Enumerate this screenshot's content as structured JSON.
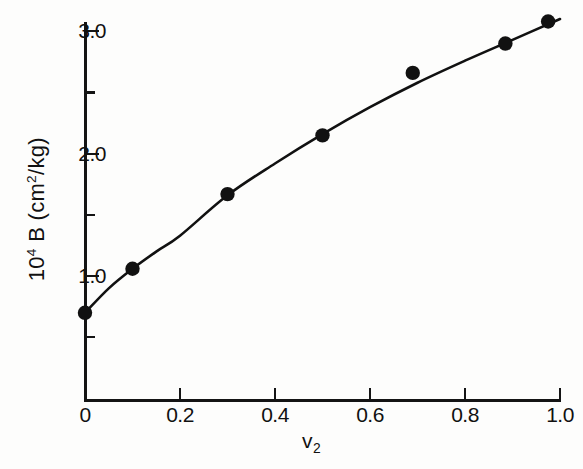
{
  "chart_data": {
    "type": "scatter",
    "title": "",
    "subtitle": "",
    "xlabel": "v2",
    "xlabel_display": "v₂",
    "ylabel": "10^4 B (cm^2/kg)",
    "ylabel_display": "10⁴ B  (cm²/kg)",
    "xlim": [
      0,
      1.0
    ],
    "ylim": [
      0,
      3.25
    ],
    "grid": false,
    "legend": null,
    "xticks": [
      0,
      0.2,
      0.4,
      0.6,
      0.8,
      1.0
    ],
    "xticklabels": [
      "0",
      "0.2",
      "0.4",
      "0.6",
      "0.8",
      "1.0"
    ],
    "yticks": [
      1.0,
      2.0,
      3.0
    ],
    "yticklabels": [
      "1.0",
      "2.0",
      "3.0"
    ],
    "yticks_minor": [
      0.5,
      1.5,
      2.5
    ],
    "marker": "filled-circle",
    "marker_color": "#111111",
    "line_color": "#111111",
    "x": [
      0.0,
      0.1,
      0.3,
      0.5,
      0.69,
      0.885,
      0.975
    ],
    "y": [
      0.7,
      1.06,
      1.67,
      2.15,
      2.66,
      2.9,
      3.08
    ],
    "series": [
      {
        "name": "B vs v2",
        "points": [
          {
            "x": 0.0,
            "y": 0.7
          },
          {
            "x": 0.1,
            "y": 1.06
          },
          {
            "x": 0.3,
            "y": 1.67
          },
          {
            "x": 0.5,
            "y": 2.15
          },
          {
            "x": 0.69,
            "y": 2.66
          },
          {
            "x": 0.885,
            "y": 2.9
          },
          {
            "x": 0.975,
            "y": 3.08
          }
        ]
      }
    ],
    "fit_curve": {
      "description": "smooth monotonic increasing fitted curve through points",
      "x": [
        0.0,
        0.05,
        0.1,
        0.15,
        0.2,
        0.3,
        0.4,
        0.5,
        0.6,
        0.7,
        0.8,
        0.9,
        1.0
      ],
      "y": [
        0.7,
        0.9,
        1.06,
        1.2,
        1.33,
        1.66,
        1.92,
        2.16,
        2.38,
        2.58,
        2.76,
        2.93,
        3.1
      ]
    }
  },
  "axes": {
    "y_ticks": [
      {
        "label": "3.0",
        "value": 3.0,
        "minor": false
      },
      {
        "label": "",
        "value": 2.5,
        "minor": true
      },
      {
        "label": "2.0",
        "value": 2.0,
        "minor": false
      },
      {
        "label": "",
        "value": 1.5,
        "minor": true
      },
      {
        "label": "1.0",
        "value": 1.0,
        "minor": false
      },
      {
        "label": "",
        "value": 0.5,
        "minor": true
      }
    ],
    "x_ticks": [
      {
        "label": "0",
        "value": 0.0
      },
      {
        "label": "0.2",
        "value": 0.2
      },
      {
        "label": "0.4",
        "value": 0.4
      },
      {
        "label": "0.6",
        "value": 0.6
      },
      {
        "label": "0.8",
        "value": 0.8
      },
      {
        "label": "1.0",
        "value": 1.0
      }
    ]
  },
  "labels": {
    "y_axis_prefix": "10",
    "y_axis_exponent": "4",
    "y_axis_mid": " B  (cm",
    "y_axis_unit_exponent": "2",
    "y_axis_suffix": "/kg)",
    "x_axis_base": "v",
    "x_axis_subscript": "2"
  },
  "colors": {
    "ink": "#111111",
    "background": "#fdfdfc"
  }
}
